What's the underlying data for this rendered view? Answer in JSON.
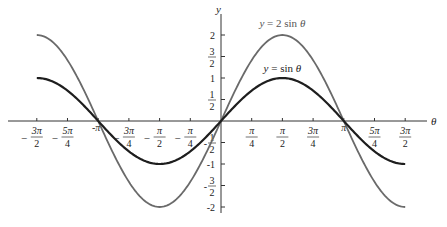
{
  "chart_data": {
    "type": "line",
    "title": "",
    "xlabel": "θ",
    "ylabel": "y",
    "xlim": [
      -4.712389,
      4.712389
    ],
    "ylim": [
      -2,
      2
    ],
    "grid": false,
    "legend_position": "inline annotations near curve peaks",
    "x_ticks": [
      {
        "value": -4.712389,
        "label": "-3π/2",
        "num": "3π",
        "den": "2",
        "neg": true
      },
      {
        "value": -3.926991,
        "label": "-5π/4",
        "num": "5π",
        "den": "4",
        "neg": true
      },
      {
        "value": -3.141593,
        "label": "-π",
        "num": "π",
        "den": "",
        "neg": true
      },
      {
        "value": -2.356194,
        "label": "-3π/4",
        "num": "3π",
        "den": "4",
        "neg": true
      },
      {
        "value": -1.570796,
        "label": "-π/2",
        "num": "π",
        "den": "2",
        "neg": true
      },
      {
        "value": -0.785398,
        "label": "-π/4",
        "num": "π",
        "den": "4",
        "neg": true
      },
      {
        "value": 0.785398,
        "label": "π/4",
        "num": "π",
        "den": "4",
        "neg": false
      },
      {
        "value": 1.570796,
        "label": "π/2",
        "num": "π",
        "den": "2",
        "neg": false
      },
      {
        "value": 2.356194,
        "label": "3π/4",
        "num": "3π",
        "den": "4",
        "neg": false
      },
      {
        "value": 3.141593,
        "label": "π",
        "num": "π",
        "den": "",
        "neg": false
      },
      {
        "value": 3.926991,
        "label": "5π/4",
        "num": "5π",
        "den": "4",
        "neg": false
      },
      {
        "value": 4.712389,
        "label": "3π/2",
        "num": "3π",
        "den": "2",
        "neg": false
      }
    ],
    "y_ticks": [
      {
        "value": 2,
        "label": "2",
        "num": "2",
        "den": "",
        "neg": false
      },
      {
        "value": 1.5,
        "label": "3/2",
        "num": "3",
        "den": "2",
        "neg": false
      },
      {
        "value": 1,
        "label": "1",
        "num": "1",
        "den": "",
        "neg": false
      },
      {
        "value": 0.5,
        "label": "1/2",
        "num": "1",
        "den": "2",
        "neg": false
      },
      {
        "value": -0.5,
        "label": "-1/2",
        "num": "1",
        "den": "2",
        "neg": true
      },
      {
        "value": -1,
        "label": "-1",
        "num": "1",
        "den": "",
        "neg": true
      },
      {
        "value": -1.5,
        "label": "-3/2",
        "num": "3",
        "den": "2",
        "neg": true
      },
      {
        "value": -2,
        "label": "-2",
        "num": "2",
        "den": "",
        "neg": true
      }
    ],
    "x": [
      -4.712389,
      -3.926991,
      -3.141593,
      -2.356194,
      -1.570796,
      -0.785398,
      0,
      0.785398,
      1.570796,
      2.356194,
      3.141593,
      3.926991,
      4.712389
    ],
    "series": [
      {
        "name": "y = sin θ",
        "function": "sin",
        "amplitude": 1,
        "color": "#1e1e1e",
        "values": [
          1,
          0.7071,
          0,
          -0.7071,
          -1,
          -0.7071,
          0,
          0.7071,
          1,
          0.7071,
          0,
          -0.7071,
          -1
        ],
        "label_pos": {
          "x_value": 1.57,
          "y_value": 1.15
        }
      },
      {
        "name": "y = 2 sin θ",
        "function": "sin",
        "amplitude": 2,
        "color": "#6a6a6a",
        "values": [
          2,
          1.4142,
          0,
          -1.4142,
          -2,
          -1.4142,
          0,
          1.4142,
          2,
          1.4142,
          0,
          -1.4142,
          -2
        ],
        "label_pos": {
          "x_value": 1.57,
          "y_value": 2.18
        }
      }
    ]
  },
  "labels": {
    "x_axis": "θ",
    "y_axis": "y",
    "series_sin": "y = sin θ",
    "series_2sin": "y = 2 sin θ"
  }
}
